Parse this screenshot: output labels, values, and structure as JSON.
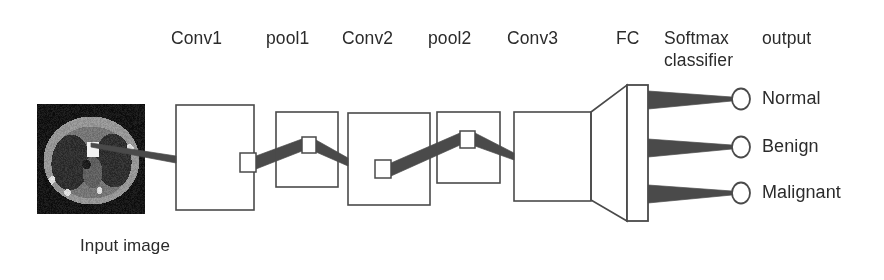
{
  "figure": {
    "title_alt": "CNN architecture for lung nodule classification",
    "stroke_color": "#4a4a4a",
    "text_color": "#2b2b2b",
    "background": "#ffffff"
  },
  "headers": [
    {
      "name": "conv1",
      "label": "Conv1",
      "x": 171,
      "y": 28
    },
    {
      "name": "pool1",
      "label": "pool1",
      "x": 266,
      "y": 28
    },
    {
      "name": "conv2",
      "label": "Conv2",
      "x": 342,
      "y": 28
    },
    {
      "name": "pool2",
      "label": "pool2",
      "x": 428,
      "y": 28
    },
    {
      "name": "conv3",
      "label": "Conv3",
      "x": 507,
      "y": 28
    },
    {
      "name": "fc",
      "label": "FC",
      "x": 616,
      "y": 28
    },
    {
      "name": "softmax",
      "label": "Softmax",
      "x": 664,
      "y": 28
    },
    {
      "name": "classifier",
      "label": "classifier",
      "x": 664,
      "y": 50
    },
    {
      "name": "output",
      "label": "output",
      "x": 762,
      "y": 28
    }
  ],
  "input": {
    "caption": "Input image",
    "caption_x": 80,
    "caption_y": 236,
    "roi_label": "region-of-interest-patch"
  },
  "layers": [
    {
      "name": "conv1",
      "x": 176,
      "y": 105,
      "w": 78,
      "h": 105,
      "patch": {
        "x": 240,
        "y": 153,
        "w": 16,
        "h": 19
      }
    },
    {
      "name": "pool1",
      "x": 276,
      "y": 112,
      "w": 62,
      "h": 75,
      "patch": {
        "x": 302,
        "y": 137,
        "w": 14,
        "h": 16
      }
    },
    {
      "name": "conv2",
      "x": 348,
      "y": 113,
      "w": 82,
      "h": 92,
      "patch": {
        "x": 375,
        "y": 160,
        "w": 16,
        "h": 18
      }
    },
    {
      "name": "pool2",
      "x": 437,
      "y": 112,
      "w": 63,
      "h": 71,
      "patch": {
        "x": 460,
        "y": 131,
        "w": 15,
        "h": 17
      }
    },
    {
      "name": "conv3",
      "x": 514,
      "y": 112,
      "w": 77,
      "h": 89,
      "patch": null
    }
  ],
  "fc_bar": {
    "name": "fully-connected-bar",
    "x": 627,
    "y": 85,
    "w": 21,
    "h": 136
  },
  "fc_cone": {
    "name": "flatten-cone",
    "points": "591,112 627,85 627,221 591,200"
  },
  "outputs": [
    {
      "name": "normal",
      "label": "Normal",
      "cx": 741,
      "cy": 99,
      "rx": 9,
      "ry": 10.5,
      "label_x": 762,
      "label_y": 89
    },
    {
      "name": "benign",
      "label": "Benign",
      "cx": 741,
      "cy": 147,
      "rx": 9,
      "ry": 10.5,
      "label_x": 762,
      "label_y": 137
    },
    {
      "name": "malignant",
      "label": "Malignant",
      "cx": 741,
      "cy": 193,
      "rx": 9,
      "ry": 10.5,
      "label_x": 762,
      "label_y": 183
    }
  ],
  "connectors": [
    {
      "name": "input-to-conv1",
      "points": "91,143 176,156 176,163 91,147"
    },
    {
      "name": "conv1-to-pool1",
      "points": "256,156 302,139 302,151 256,169"
    },
    {
      "name": "pool1-to-conv2",
      "points": "316,140 348,158 348,166 316,152"
    },
    {
      "name": "conv2-to-pool2",
      "points": "391,163 460,133 460,145 391,176"
    },
    {
      "name": "pool2-to-conv3",
      "points": "475,133 514,153 514,160 475,146"
    },
    {
      "name": "fc-to-normal",
      "points": "648,91 732,97 732,101 648,109"
    },
    {
      "name": "fc-to-benign",
      "points": "648,139 732,145 732,149 648,157"
    },
    {
      "name": "fc-to-malignant",
      "points": "648,185 732,191 732,195 648,203"
    }
  ]
}
